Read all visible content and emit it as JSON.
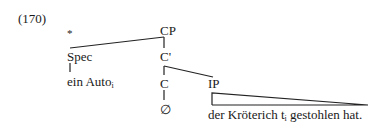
{
  "example_number": "(170)",
  "ungrammatical_mark": "*",
  "tree": {
    "root": "CP",
    "spec": "Spec",
    "c_bar": "C'",
    "c_head": "C",
    "ip": "IP",
    "empty_c": "∅",
    "spec_content": {
      "text": "ein Auto",
      "index": "i"
    },
    "ip_content": {
      "before": "der Kröterich t",
      "index": "i",
      "after": " gestohlen hat."
    }
  }
}
